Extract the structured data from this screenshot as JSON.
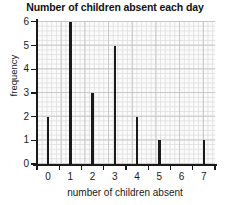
{
  "chart_data": {
    "type": "bar",
    "title": "Number of children absent each day",
    "xlabel": "number of children absent",
    "ylabel": "frequency",
    "categories": [
      "0",
      "1",
      "2",
      "3",
      "4",
      "5",
      "6",
      "7"
    ],
    "values": [
      2,
      6,
      3,
      5,
      2,
      1,
      0,
      1
    ],
    "xlim": [
      -0.5,
      7.5
    ],
    "ylim": [
      0,
      6
    ],
    "ytick_labels": [
      "0",
      "1",
      "2",
      "3",
      "4",
      "5",
      "6"
    ],
    "ytick_values": [
      0,
      1,
      2,
      3,
      4,
      5,
      6
    ],
    "xtick_labels": [
      "0",
      "1",
      "2",
      "3",
      "4",
      "5",
      "6",
      "7"
    ],
    "grid": true,
    "grid_style": "graph-paper",
    "legend": null,
    "bar_color": "#1a1a1a",
    "grid_color_minor": "#e2e2e2",
    "grid_color_major": "#c8c8c8",
    "axis_color": "#1a1a1a",
    "background": "#ffffff",
    "plot_background": "#fbfbfb"
  }
}
